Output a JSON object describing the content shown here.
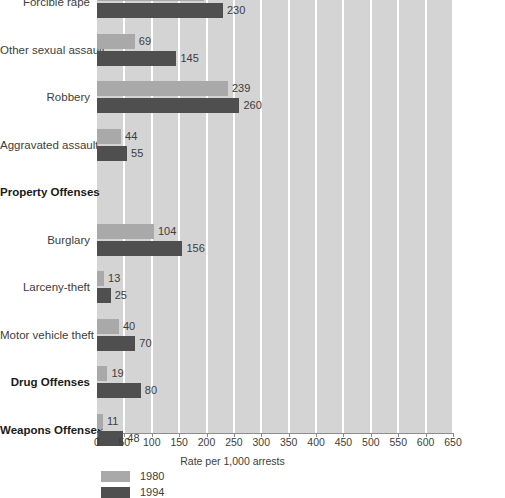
{
  "chart_data": {
    "type": "bar",
    "orientation": "horizontal",
    "title": "",
    "xlabel": "Rate per 1,000 arrests",
    "ylabel": "",
    "xlim": [
      0,
      650
    ],
    "xticks": [
      0,
      50,
      100,
      150,
      200,
      250,
      300,
      350,
      400,
      450,
      500,
      550,
      600,
      650
    ],
    "xtick_labels": [
      "0",
      "50",
      "100",
      "150",
      "200",
      "250",
      "300",
      "350",
      "400",
      "450",
      "500",
      "550",
      "600",
      "650"
    ],
    "grid": "vertical",
    "legend_position": "below-left",
    "note": "Chart is cropped at the top; the first category row (Forcible rape) and its 1980 bar label are partially cut off.",
    "categories": [
      {
        "label": "Forcible rape",
        "header": false,
        "cropped": true
      },
      {
        "label": "Other sexual assault",
        "header": false
      },
      {
        "label": "Robbery",
        "header": false
      },
      {
        "label": "Aggravated assault",
        "header": false
      },
      {
        "label": "Property Offenses",
        "header": true
      },
      {
        "label": "Burglary",
        "header": false
      },
      {
        "label": "Larceny-theft",
        "header": false
      },
      {
        "label": "Motor vehicle theft",
        "header": false
      },
      {
        "label": "Drug Offenses",
        "header": true
      },
      {
        "label": "Weapons Offenses",
        "header": true
      }
    ],
    "series": [
      {
        "name": "1980",
        "color": "#a9a9a9",
        "values": [
          196,
          69,
          239,
          44,
          null,
          104,
          13,
          40,
          19,
          11
        ]
      },
      {
        "name": "1994",
        "color": "#4f4f4f",
        "values": [
          230,
          145,
          260,
          55,
          null,
          156,
          25,
          70,
          80,
          48
        ]
      }
    ]
  },
  "legend": {
    "items": [
      {
        "label": "1980",
        "color": "#a9a9a9"
      },
      {
        "label": "1994",
        "color": "#4f4f4f"
      }
    ]
  },
  "colors": {
    "plot_background": "#d4d4d4",
    "gridline": "#ffffff",
    "series_1980": "#a9a9a9",
    "series_1994": "#4f4f4f",
    "text": "#3d3d3d",
    "header_text": "#1a1a1a"
  }
}
